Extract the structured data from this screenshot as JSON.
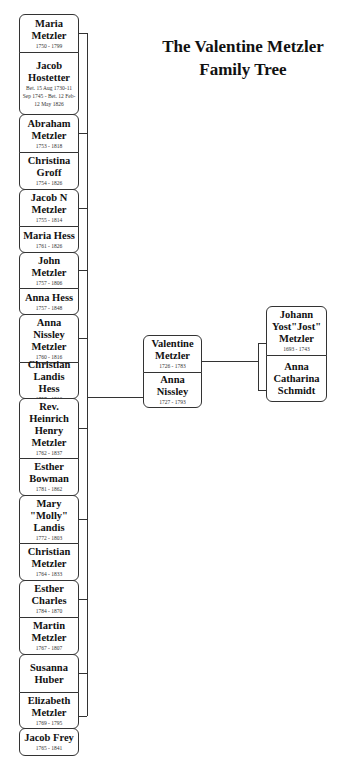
{
  "title": {
    "line1": "The Valentine Metzler",
    "line2": "Family Tree"
  },
  "children": [
    {
      "name": "Maria Metzler",
      "dates": "1750 - 1799",
      "top": 14,
      "bottom": 52
    },
    {
      "name": "Jacob Hostetter",
      "dates": "Bet. 15 Aug 1730-11 Sep 1745 - Bet. 12 Feb-12 May 1826",
      "top": 52,
      "bottom": 114
    },
    {
      "name": "Abraham Metzler",
      "dates": "1753 - 1818",
      "top": 114,
      "bottom": 152
    },
    {
      "name": "Christina Groff",
      "dates": "1754 - 1826",
      "top": 152,
      "bottom": 189
    },
    {
      "name": "Jacob N Metzler",
      "dates": "1755 - 1814",
      "top": 189,
      "bottom": 226
    },
    {
      "name": "Maria Hess",
      "dates": "1761 - 1826",
      "top": 226,
      "bottom": 252
    },
    {
      "name": "John Metzler",
      "dates": "1757 - 1806",
      "top": 252,
      "bottom": 288
    },
    {
      "name": "Anna Hess",
      "dates": "1757 - 1848",
      "top": 288,
      "bottom": 314
    },
    {
      "name": "Anna Nissley Metzler",
      "dates": "1760 - 1816",
      "top": 314,
      "bottom": 362
    },
    {
      "name": "Christian Landis Hess",
      "dates": "1757 - 1816",
      "top": 362,
      "bottom": 398
    },
    {
      "name": "Rev. Heinrich Henry Metzler",
      "dates": "1762 - 1837",
      "top": 398,
      "bottom": 458
    },
    {
      "name": "Esther Bowman",
      "dates": "1781 - 1862",
      "top": 458,
      "bottom": 495
    },
    {
      "name": "Mary \"Molly\" Landis",
      "dates": "1772 - 1803",
      "top": 495,
      "bottom": 543
    },
    {
      "name": "Christian Metzler",
      "dates": "1764 - 1833",
      "top": 543,
      "bottom": 580
    },
    {
      "name": "Esther Charles",
      "dates": "1784 - 1870",
      "top": 580,
      "bottom": 617
    },
    {
      "name": "Martin Metzler",
      "dates": "1767 - 1807",
      "top": 617,
      "bottom": 654
    },
    {
      "name": "Susanna Huber",
      "dates": "",
      "top": 654,
      "bottom": 692
    },
    {
      "name": "Elizabeth Metzler",
      "dates": "1769 - 1795",
      "top": 692,
      "bottom": 728
    },
    {
      "name": "Jacob Frey",
      "dates": "1765 - 1841",
      "top": 728,
      "bottom": 755
    }
  ],
  "parents": {
    "father": {
      "name": "Valentine Metzler",
      "dates": "1726 - 1783"
    },
    "mother": {
      "name": "Anna Nissley",
      "dates": "1727 - 1793"
    }
  },
  "grandparents": {
    "father": {
      "name": "Johann Yost\"Jost\" Metzler",
      "dates": "1693 - 1743"
    },
    "mother": {
      "name": "Anna Catharina Schmidt",
      "dates": ""
    }
  },
  "colors": {
    "line": "#333333",
    "background": "#ffffff",
    "text": "#111111"
  }
}
